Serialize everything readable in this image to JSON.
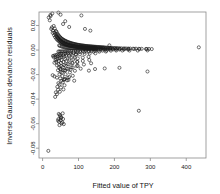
{
  "chart_data": {
    "type": "scatter",
    "title": "",
    "xlabel": "Fitted value of TPY",
    "ylabel": "Inverse Gaussian deviance residuals",
    "xlim": [
      -10,
      455
    ],
    "ylim": [
      -0.088,
      0.031
    ],
    "grid": false,
    "legend": null,
    "xticks": [
      0,
      100,
      200,
      300,
      400
    ],
    "xtick_labels": [
      "0",
      "100",
      "200",
      "300",
      "400"
    ],
    "yticks": [
      0.02,
      0.0,
      -0.02,
      -0.04,
      -0.06,
      -0.08
    ],
    "ytick_labels": [
      "0.02",
      "0.00",
      "-0.02",
      "-0.04",
      "-0.06",
      "-0.08"
    ],
    "marker": "open-circle",
    "marker_color": "#1a1a1a",
    "series": [
      {
        "name": "residuals",
        "x": [
          17,
          22,
          26,
          29,
          31,
          33,
          34,
          36,
          37,
          38,
          39,
          40,
          41,
          42,
          43,
          44,
          45,
          46,
          47,
          48,
          49,
          50,
          51,
          52,
          53,
          54,
          55,
          56,
          57,
          58,
          59,
          60,
          61,
          62,
          63,
          64,
          65,
          66,
          67,
          68,
          69,
          70,
          71,
          72,
          73,
          74,
          75,
          76,
          77,
          78,
          79,
          80,
          81,
          82,
          83,
          84,
          85,
          86,
          87,
          88,
          89,
          90,
          91,
          92,
          93,
          94,
          95,
          96,
          97,
          98,
          99,
          100,
          101,
          102,
          103,
          104,
          105,
          106,
          107,
          108,
          109,
          110,
          111,
          112,
          113,
          114,
          115,
          116,
          117,
          118,
          119,
          120,
          121,
          122,
          123,
          124,
          125,
          126,
          127,
          128,
          129,
          130,
          131,
          132,
          133,
          134,
          135,
          136,
          137,
          138,
          139,
          140,
          141,
          142,
          143,
          144,
          145,
          146,
          147,
          148,
          149,
          150,
          152,
          154,
          156,
          158,
          160,
          162,
          164,
          166,
          168,
          170,
          172,
          175,
          178,
          181,
          184,
          187,
          190,
          194,
          198,
          202,
          206,
          210,
          215,
          220,
          226,
          232,
          238,
          244,
          252,
          260,
          268,
          276,
          288,
          296,
          304,
          435,
          20,
          24,
          28,
          32,
          35,
          38,
          41,
          44,
          47,
          50,
          53,
          56,
          59,
          62,
          65,
          68,
          71,
          74,
          77,
          80,
          83,
          86,
          89,
          92,
          95,
          98,
          101,
          104,
          107,
          110,
          113,
          116,
          119,
          122,
          125,
          128,
          131,
          134,
          137,
          140,
          143,
          146,
          150,
          155,
          160,
          165,
          170,
          176,
          182,
          188,
          195,
          205,
          215,
          228,
          240,
          255,
          270,
          290,
          46,
          48,
          52,
          55,
          58,
          61,
          64,
          67,
          70,
          73,
          76,
          79,
          82,
          85,
          88,
          91,
          94,
          97,
          100,
          103,
          106,
          109,
          112,
          115,
          118,
          121,
          124,
          127,
          130,
          133,
          136,
          139,
          142,
          145,
          148,
          151,
          156,
          162,
          168,
          174,
          180,
          188,
          196,
          204,
          214,
          226,
          238,
          44,
          47,
          50,
          54,
          58,
          62,
          66,
          70,
          75,
          80,
          86,
          92,
          98,
          105,
          112,
          120,
          128,
          137,
          146,
          156,
          167,
          178,
          190,
          205,
          222,
          242,
          265,
          292,
          29,
          33,
          38,
          42,
          47,
          52,
          58,
          64,
          70,
          78,
          86,
          95,
          105,
          116,
          128,
          142,
          158,
          176,
          36,
          39,
          43,
          48,
          53,
          59,
          66,
          74,
          83,
          93,
          104,
          117,
          131,
          147,
          40,
          45,
          51,
          58,
          66,
          75,
          86,
          98,
          112,
          128,
          43,
          49,
          56,
          64,
          73,
          84,
          97,
          112,
          130,
          47,
          54,
          62,
          72,
          84,
          98,
          115,
          135,
          31,
          36,
          42,
          49,
          57,
          67,
          79,
          93,
          33,
          38,
          45,
          53,
          63,
          75,
          89,
          46,
          52,
          60,
          70,
          82,
          96,
          50,
          58,
          68,
          80,
          95,
          55,
          64,
          76,
          90,
          59,
          70,
          84,
          44,
          52,
          62,
          74,
          41,
          47,
          56,
          68,
          37,
          43,
          51,
          61,
          35,
          40,
          48,
          58,
          50,
          63,
          78,
          106,
          129,
          146,
          173,
          214,
          28,
          33,
          40,
          49,
          60,
          72,
          88,
          56,
          48,
          52,
          44,
          50,
          46,
          53,
          57,
          49,
          45,
          51,
          47,
          43,
          55,
          59,
          22,
          27,
          44,
          50,
          57,
          63,
          74,
          108,
          118,
          133,
          186,
          268,
          292,
          16
        ],
        "y": [
          0.0265,
          0.0286,
          0.0185,
          0.0158,
          0.0196,
          0.0142,
          0.0175,
          0.0129,
          0.0155,
          0.0117,
          0.0148,
          0.0108,
          0.0133,
          0.0099,
          0.0125,
          0.0091,
          0.0118,
          0.0085,
          0.011,
          0.0079,
          0.0104,
          0.0074,
          0.0098,
          0.0069,
          0.0093,
          0.0065,
          0.0089,
          0.0061,
          0.0085,
          0.0058,
          0.0081,
          0.0055,
          0.0078,
          0.0052,
          0.0075,
          0.0049,
          0.0072,
          0.0047,
          0.0069,
          0.0045,
          0.0067,
          0.0043,
          0.0064,
          0.0041,
          0.0062,
          0.0039,
          0.006,
          0.0038,
          0.0058,
          0.0036,
          0.0056,
          0.0035,
          0.0054,
          0.0033,
          0.0053,
          0.0032,
          0.0051,
          0.0031,
          0.005,
          0.003,
          0.0048,
          0.0029,
          0.0047,
          0.0028,
          0.0046,
          0.0027,
          0.0044,
          0.0026,
          0.0043,
          0.0025,
          0.0042,
          0.0024,
          0.0041,
          0.0024,
          0.004,
          0.0023,
          0.0039,
          0.0022,
          0.0038,
          0.0022,
          0.0037,
          0.0021,
          0.0036,
          0.0021,
          0.0036,
          0.002,
          0.0035,
          0.002,
          0.0034,
          0.0019,
          0.0033,
          0.0019,
          0.0033,
          0.0018,
          0.0032,
          0.0018,
          0.0031,
          0.0018,
          0.0031,
          0.0017,
          0.003,
          0.0017,
          0.003,
          0.0016,
          0.0029,
          0.0016,
          0.0029,
          0.0016,
          0.0028,
          0.0015,
          0.0028,
          0.0015,
          0.0027,
          0.0015,
          0.0027,
          0.0015,
          0.0026,
          0.0014,
          0.0026,
          0.0014,
          0.0026,
          0.0014,
          0.0025,
          0.0024,
          0.0024,
          0.0023,
          0.0023,
          0.0022,
          0.0022,
          0.0021,
          0.0021,
          0.0021,
          0.002,
          0.002,
          0.0019,
          0.0019,
          0.0018,
          0.0018,
          0.0017,
          0.0017,
          0.0016,
          0.0016,
          0.0015,
          0.0015,
          0.0014,
          0.0014,
          0.0013,
          0.0013,
          0.0012,
          0.0012,
          0.0011,
          0.0011,
          0.001,
          0.001,
          0.0009,
          0.0009,
          0.0008,
          0.0022,
          0.0242,
          0.0172,
          0.014,
          0.0121,
          0.0105,
          0.0093,
          0.0083,
          0.0075,
          0.0069,
          0.0063,
          0.0058,
          0.0054,
          0.005,
          0.0047,
          0.0044,
          0.0042,
          0.0039,
          0.0037,
          0.0035,
          0.0034,
          0.0032,
          0.0031,
          0.0029,
          0.0028,
          0.0027,
          0.0026,
          0.0025,
          0.0024,
          0.0023,
          0.0023,
          0.0022,
          0.0021,
          0.0021,
          0.002,
          0.0019,
          0.0019,
          0.0018,
          0.0018,
          0.0017,
          0.0017,
          0.0016,
          0.0016,
          0.0015,
          0.0015,
          0.0014,
          0.0014,
          0.0013,
          0.0013,
          0.0012,
          0.0012,
          0.0011,
          0.0011,
          0.001,
          0.001,
          0.0009,
          0.0009,
          0.0008,
          0.0008,
          0.0038,
          0.0034,
          0.003,
          0.0027,
          0.0025,
          0.0023,
          0.0021,
          0.002,
          0.0018,
          0.0017,
          0.0016,
          0.0015,
          0.0015,
          0.0014,
          0.0013,
          0.0013,
          0.0012,
          0.0012,
          0.0011,
          0.0011,
          0.001,
          0.001,
          0.001,
          0.0009,
          0.0009,
          0.0009,
          0.0008,
          0.0008,
          0.0008,
          0.0008,
          0.0007,
          0.0007,
          0.0007,
          0.0007,
          0.0007,
          0.0006,
          0.0006,
          0.0006,
          0.0006,
          0.0005,
          0.0005,
          0.0005,
          0.0005,
          0.0004,
          0.0004,
          0.0004,
          0.0004,
          -0.0012,
          -0.0012,
          -0.0011,
          -0.0011,
          -0.001,
          -0.001,
          -0.0009,
          -0.0009,
          -0.0009,
          -0.0008,
          -0.0008,
          -0.0008,
          -0.0007,
          -0.0007,
          -0.0007,
          -0.0006,
          -0.0006,
          -0.0006,
          -0.0006,
          -0.0005,
          -0.0005,
          -0.0005,
          -0.0005,
          -0.0004,
          -0.0004,
          -0.0004,
          -0.0004,
          -0.0003,
          -0.0048,
          -0.0044,
          -0.004,
          -0.0037,
          -0.0034,
          -0.0031,
          -0.0029,
          -0.0026,
          -0.0024,
          -0.0022,
          -0.0021,
          -0.0019,
          -0.0018,
          -0.0016,
          -0.0015,
          -0.0014,
          -0.0013,
          -0.0012,
          -0.0082,
          -0.0076,
          -0.007,
          -0.0064,
          -0.0059,
          -0.0054,
          -0.005,
          -0.0046,
          -0.0042,
          -0.0038,
          -0.0035,
          -0.0032,
          -0.0029,
          -0.0027,
          -0.0125,
          -0.0116,
          -0.0106,
          -0.0097,
          -0.0089,
          -0.0081,
          -0.0074,
          -0.0068,
          -0.0062,
          -0.0056,
          -0.0165,
          -0.0152,
          -0.014,
          -0.0128,
          -0.0117,
          -0.0107,
          -0.0098,
          -0.0089,
          -0.0081,
          -0.0198,
          -0.0183,
          -0.0168,
          -0.0154,
          -0.0141,
          -0.0129,
          -0.0118,
          -0.0108,
          -0.0058,
          -0.0054,
          -0.005,
          -0.0046,
          -0.0042,
          -0.0039,
          -0.0036,
          -0.0033,
          -0.0104,
          -0.0096,
          -0.0089,
          -0.0082,
          -0.0075,
          -0.0069,
          -0.0064,
          -0.0142,
          -0.0132,
          -0.0122,
          -0.0113,
          -0.0104,
          -0.0096,
          -0.0178,
          -0.0165,
          -0.0153,
          -0.0141,
          -0.0131,
          -0.0212,
          -0.0197,
          -0.0183,
          -0.0169,
          -0.0243,
          -0.0226,
          -0.021,
          -0.027,
          -0.0252,
          -0.0236,
          -0.022,
          -0.03,
          -0.0281,
          -0.0263,
          -0.0247,
          -0.0345,
          -0.0324,
          -0.0305,
          -0.0287,
          -0.0382,
          -0.036,
          -0.034,
          -0.0321,
          -0.0158,
          -0.0165,
          -0.016,
          -0.0152,
          -0.0168,
          -0.0155,
          -0.015,
          -0.0145,
          -0.0205,
          -0.0215,
          -0.0225,
          -0.0232,
          -0.0238,
          -0.0244,
          -0.025,
          -0.0516,
          -0.0529,
          -0.0548,
          -0.0563,
          -0.0572,
          -0.0585,
          -0.0598,
          -0.0562,
          -0.054,
          -0.0521,
          -0.0555,
          -0.0612,
          -0.0575,
          -0.059,
          -0.0604,
          0.0276,
          0.0298,
          0.0305,
          0.0288,
          0.0212,
          0.0235,
          0.0188,
          0.0282,
          0.0172,
          0.0158,
          0.0038,
          -0.0495,
          -0.0175,
          -0.0822
        ]
      }
    ]
  }
}
